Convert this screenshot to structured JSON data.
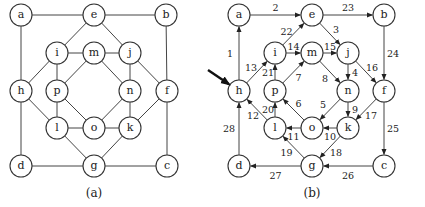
{
  "graphs": [
    {
      "id": "a",
      "caption": "(a)",
      "directed": false,
      "offset_x": 0,
      "nodes": [
        {
          "id": "a",
          "label": "a",
          "x": 21,
          "y": 15
        },
        {
          "id": "e",
          "label": "e",
          "x": 94,
          "y": 15
        },
        {
          "id": "b",
          "label": "b",
          "x": 166,
          "y": 15
        },
        {
          "id": "i",
          "label": "i",
          "x": 57,
          "y": 53
        },
        {
          "id": "m",
          "label": "m",
          "x": 94,
          "y": 53
        },
        {
          "id": "j",
          "label": "j",
          "x": 130,
          "y": 53
        },
        {
          "id": "h",
          "label": "h",
          "x": 21,
          "y": 91
        },
        {
          "id": "p",
          "label": "p",
          "x": 57,
          "y": 91
        },
        {
          "id": "n",
          "label": "n",
          "x": 130,
          "y": 91
        },
        {
          "id": "f",
          "label": "f",
          "x": 167,
          "y": 91
        },
        {
          "id": "l",
          "label": "l",
          "x": 57,
          "y": 128
        },
        {
          "id": "o",
          "label": "o",
          "x": 94,
          "y": 128
        },
        {
          "id": "k",
          "label": "k",
          "x": 130,
          "y": 128
        },
        {
          "id": "d",
          "label": "d",
          "x": 21,
          "y": 166
        },
        {
          "id": "g",
          "label": "g",
          "x": 94,
          "y": 166
        },
        {
          "id": "c",
          "label": "c",
          "x": 167,
          "y": 166
        }
      ],
      "edges": [
        [
          "a",
          "e"
        ],
        [
          "e",
          "b"
        ],
        [
          "a",
          "h"
        ],
        [
          "b",
          "f"
        ],
        [
          "h",
          "d"
        ],
        [
          "f",
          "c"
        ],
        [
          "d",
          "g"
        ],
        [
          "g",
          "c"
        ],
        [
          "e",
          "i"
        ],
        [
          "e",
          "j"
        ],
        [
          "i",
          "m"
        ],
        [
          "m",
          "j"
        ],
        [
          "i",
          "h"
        ],
        [
          "j",
          "f"
        ],
        [
          "i",
          "p"
        ],
        [
          "j",
          "n"
        ],
        [
          "m",
          "p"
        ],
        [
          "m",
          "n"
        ],
        [
          "h",
          "l"
        ],
        [
          "f",
          "k"
        ],
        [
          "p",
          "l"
        ],
        [
          "n",
          "k"
        ],
        [
          "p",
          "o"
        ],
        [
          "n",
          "o"
        ],
        [
          "l",
          "o"
        ],
        [
          "o",
          "k"
        ],
        [
          "l",
          "g"
        ],
        [
          "k",
          "g"
        ]
      ]
    },
    {
      "id": "b",
      "caption": "(b)",
      "directed": true,
      "offset_x": 218,
      "start_arrow": {
        "target": "h",
        "from_x": 208,
        "from_y": 70
      },
      "nodes": [
        {
          "id": "a",
          "label": "a",
          "x": 21,
          "y": 15
        },
        {
          "id": "e",
          "label": "e",
          "x": 94,
          "y": 15
        },
        {
          "id": "b",
          "label": "b",
          "x": 166,
          "y": 15
        },
        {
          "id": "i",
          "label": "i",
          "x": 57,
          "y": 53
        },
        {
          "id": "m",
          "label": "m",
          "x": 94,
          "y": 53
        },
        {
          "id": "j",
          "label": "j",
          "x": 130,
          "y": 53
        },
        {
          "id": "h",
          "label": "h",
          "x": 21,
          "y": 91
        },
        {
          "id": "p",
          "label": "p",
          "x": 57,
          "y": 91
        },
        {
          "id": "n",
          "label": "n",
          "x": 130,
          "y": 91
        },
        {
          "id": "f",
          "label": "f",
          "x": 166,
          "y": 91
        },
        {
          "id": "l",
          "label": "l",
          "x": 57,
          "y": 128
        },
        {
          "id": "o",
          "label": "o",
          "x": 94,
          "y": 128
        },
        {
          "id": "k",
          "label": "k",
          "x": 130,
          "y": 128
        },
        {
          "id": "d",
          "label": "d",
          "x": 21,
          "y": 166
        },
        {
          "id": "g",
          "label": "g",
          "x": 94,
          "y": 166
        },
        {
          "id": "c",
          "label": "c",
          "x": 166,
          "y": 166
        }
      ],
      "edges": [
        {
          "from": "h",
          "to": "a",
          "label": "1",
          "lx": -9,
          "ly": 0
        },
        {
          "from": "a",
          "to": "e",
          "label": "2",
          "lx": 0,
          "ly": -8
        },
        {
          "from": "e",
          "to": "j",
          "label": "3",
          "lx": 6,
          "ly": -5
        },
        {
          "from": "j",
          "to": "n",
          "label": "4",
          "lx": 7,
          "ly": 0
        },
        {
          "from": "n",
          "to": "o",
          "label": "5",
          "lx": -7,
          "ly": -5
        },
        {
          "from": "o",
          "to": "p",
          "label": "6",
          "lx": 5,
          "ly": -6
        },
        {
          "from": "p",
          "to": "m",
          "label": "7",
          "lx": 5,
          "ly": 5
        },
        {
          "from": "m",
          "to": "n",
          "label": "8",
          "lx": -5,
          "ly": 6
        },
        {
          "from": "n",
          "to": "k",
          "label": "9",
          "lx": 7,
          "ly": 0
        },
        {
          "from": "k",
          "to": "o",
          "label": "10",
          "lx": 0,
          "ly": 8
        },
        {
          "from": "o",
          "to": "l",
          "label": "11",
          "lx": 0,
          "ly": 8
        },
        {
          "from": "l",
          "to": "h",
          "label": "12",
          "lx": -4,
          "ly": 6
        },
        {
          "from": "h",
          "to": "i",
          "label": "13",
          "lx": -6,
          "ly": -5
        },
        {
          "from": "i",
          "to": "m",
          "label": "14",
          "lx": 0,
          "ly": -7
        },
        {
          "from": "m",
          "to": "j",
          "label": "15",
          "lx": 0,
          "ly": -7
        },
        {
          "from": "j",
          "to": "f",
          "label": "16",
          "lx": 6,
          "ly": -5
        },
        {
          "from": "f",
          "to": "k",
          "label": "17",
          "lx": 5,
          "ly": 6
        },
        {
          "from": "k",
          "to": "g",
          "label": "18",
          "lx": 6,
          "ly": 5
        },
        {
          "from": "g",
          "to": "l",
          "label": "19",
          "lx": -7,
          "ly": 5
        },
        {
          "from": "l",
          "to": "p",
          "label": "20",
          "lx": -7,
          "ly": 0
        },
        {
          "from": "p",
          "to": "i",
          "label": "21",
          "lx": -7,
          "ly": 0
        },
        {
          "from": "i",
          "to": "e",
          "label": "22",
          "lx": -7,
          "ly": -3
        },
        {
          "from": "e",
          "to": "b",
          "label": "23",
          "lx": 0,
          "ly": -8
        },
        {
          "from": "b",
          "to": "f",
          "label": "24",
          "lx": 9,
          "ly": 0
        },
        {
          "from": "f",
          "to": "c",
          "label": "25",
          "lx": 9,
          "ly": 0
        },
        {
          "from": "c",
          "to": "g",
          "label": "26",
          "lx": 0,
          "ly": 9
        },
        {
          "from": "g",
          "to": "d",
          "label": "27",
          "lx": 0,
          "ly": 9
        },
        {
          "from": "d",
          "to": "h",
          "label": "28",
          "lx": -10,
          "ly": 0
        }
      ]
    }
  ],
  "style": {
    "node_radius": 11,
    "stroke_color": "#333333",
    "arrow_color": "#111111"
  }
}
